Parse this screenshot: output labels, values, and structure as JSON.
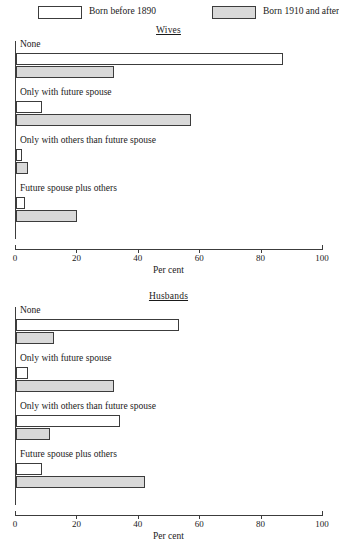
{
  "legend": {
    "entries": [
      {
        "label": "Born before 1890",
        "swatch": "white",
        "color": "#ffffff"
      },
      {
        "label": "Born 1910 and after",
        "swatch": "gray",
        "color": "#d9d9d9"
      }
    ]
  },
  "axis": {
    "title": "Per cent",
    "ticks": [
      0,
      20,
      40,
      60,
      80,
      100
    ],
    "tick_labels": [
      "0",
      "20",
      "40",
      "60",
      "80",
      "100"
    ]
  },
  "chart_data": [
    {
      "type": "bar",
      "title": "Wives",
      "orientation": "horizontal",
      "xlabel": "Per cent",
      "ylabel": "",
      "xlim": [
        0,
        100
      ],
      "xticks": [
        0,
        20,
        40,
        60,
        80,
        100
      ],
      "grid": false,
      "legend_position": "top",
      "categories": [
        "None",
        "Only with future spouse",
        "Only with others than future spouse",
        "Future spouse plus others"
      ],
      "series": [
        {
          "name": "Born before 1890",
          "color": "#ffffff",
          "values": [
            87,
            8.5,
            2,
            3
          ]
        },
        {
          "name": "Born 1910 and after",
          "color": "#d9d9d9",
          "values": [
            32,
            57,
            4,
            20
          ]
        }
      ]
    },
    {
      "type": "bar",
      "title": "Husbands",
      "orientation": "horizontal",
      "xlabel": "Per cent",
      "ylabel": "",
      "xlim": [
        0,
        100
      ],
      "xticks": [
        0,
        20,
        40,
        60,
        80,
        100
      ],
      "grid": false,
      "legend_position": "top",
      "categories": [
        "None",
        "Only with future spouse",
        "Only with others than future spouse",
        "Future spouse plus others"
      ],
      "series": [
        {
          "name": "Born before 1890",
          "color": "#ffffff",
          "values": [
            53,
            4,
            34,
            8.5
          ]
        },
        {
          "name": "Born 1910 and after",
          "color": "#d9d9d9",
          "values": [
            12.5,
            32,
            11,
            42
          ]
        }
      ]
    }
  ]
}
